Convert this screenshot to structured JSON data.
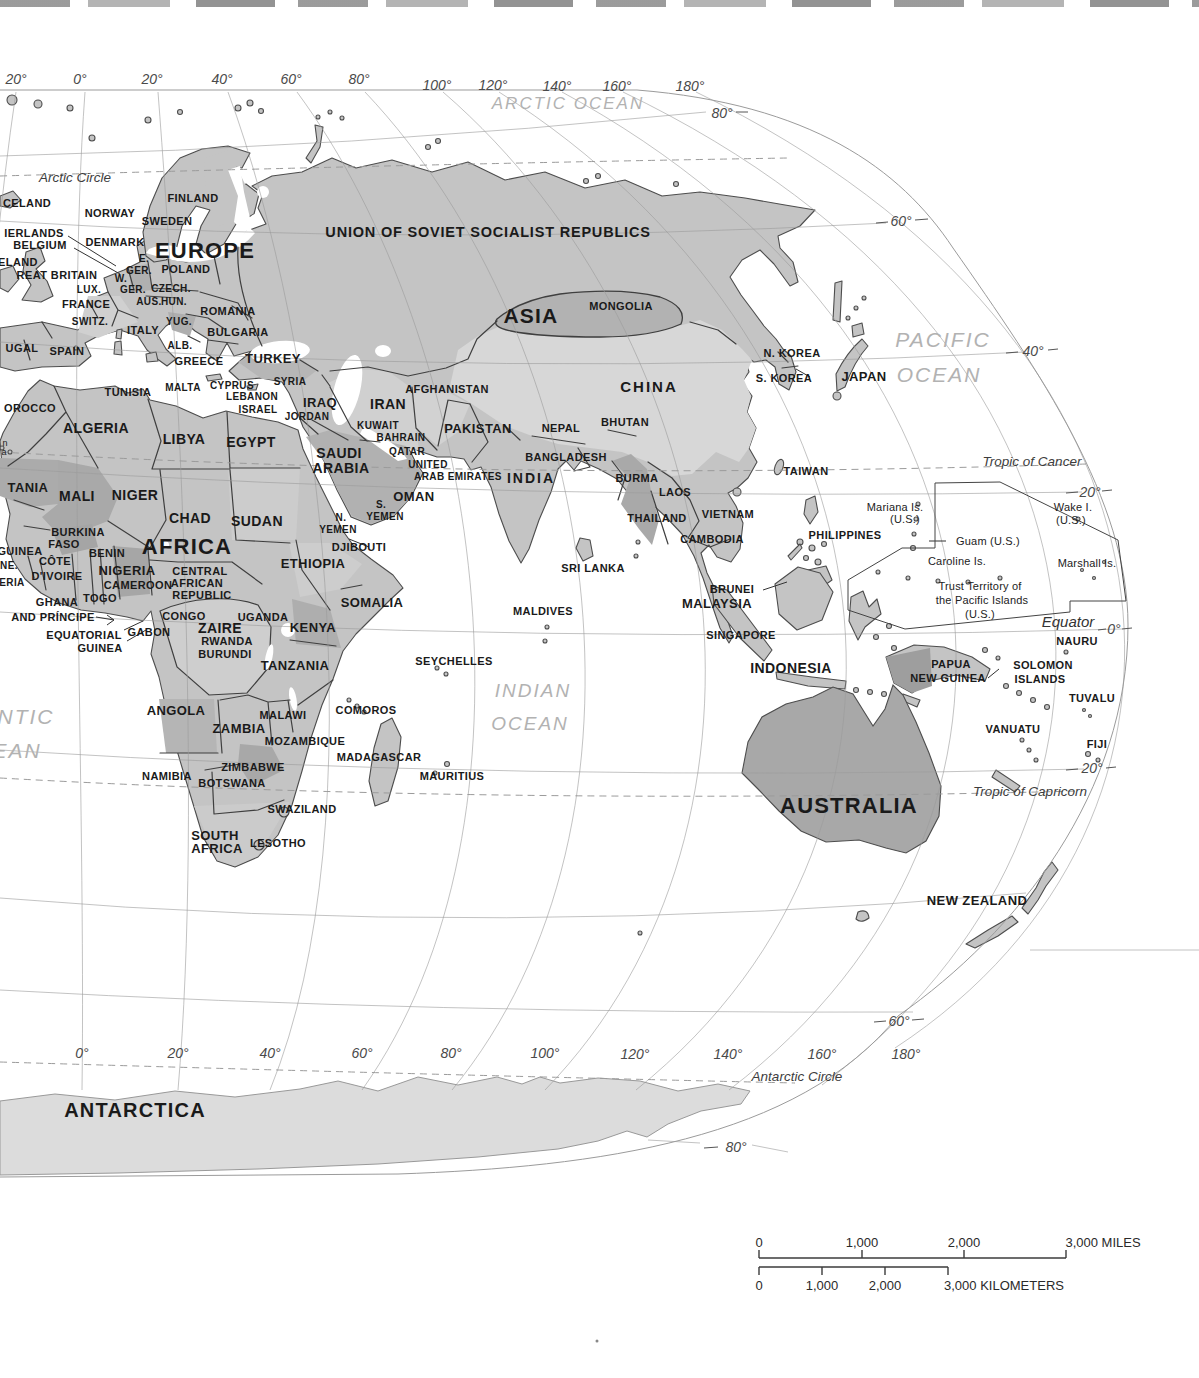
{
  "colors": {
    "paper": "#ffffff",
    "land": "#c4c4c4",
    "land_dark": "#a8a8a8",
    "land_mid": "#b6b6b6",
    "land_light": "#d6d6d6",
    "ice": "#dcdcdc",
    "coast": "#4d4d4d",
    "border": "#3f3f3f",
    "graticule": "#9b9b9b",
    "label": "#1a1a1a",
    "ocean_label": "#b2b2b2"
  },
  "scale_bar": {
    "miles": {
      "ticks": [
        "0",
        "1,000",
        "2,000"
      ],
      "end_label": "3,000 MILES"
    },
    "kilometers": {
      "ticks": [
        "0",
        "1,000",
        "2,000"
      ],
      "end_label": "3,000 KILOMETERS"
    }
  },
  "labels": [
    {
      "t": "20°",
      "x": 16,
      "y": 79,
      "c": "coord"
    },
    {
      "t": "0°",
      "x": 80,
      "y": 79,
      "c": "coord"
    },
    {
      "t": "20°",
      "x": 152,
      "y": 79,
      "c": "coord"
    },
    {
      "t": "40°",
      "x": 222,
      "y": 79,
      "c": "coord"
    },
    {
      "t": "60°",
      "x": 291,
      "y": 79,
      "c": "coord"
    },
    {
      "t": "80°",
      "x": 359,
      "y": 79,
      "c": "coord"
    },
    {
      "t": "100°",
      "x": 437,
      "y": 85,
      "c": "coord"
    },
    {
      "t": "120°",
      "x": 493,
      "y": 85,
      "c": "coord"
    },
    {
      "t": "140°",
      "x": 557,
      "y": 86,
      "c": "coord"
    },
    {
      "t": "160°",
      "x": 617,
      "y": 86,
      "c": "coord"
    },
    {
      "t": "180°",
      "x": 690,
      "y": 86,
      "c": "coord"
    },
    {
      "t": "80°",
      "x": 722,
      "y": 113,
      "c": "coord"
    },
    {
      "t": "60°",
      "x": 901,
      "y": 221,
      "c": "coord"
    },
    {
      "t": "40°",
      "x": 1033,
      "y": 351,
      "c": "coord"
    },
    {
      "t": "20°",
      "x": 1090,
      "y": 492,
      "c": "coord"
    },
    {
      "t": "0°",
      "x": 1114,
      "y": 629,
      "c": "coord"
    },
    {
      "t": "20°",
      "x": 1092,
      "y": 768,
      "c": "coord"
    },
    {
      "t": "60°",
      "x": 899,
      "y": 1021,
      "c": "coord"
    },
    {
      "t": "80°",
      "x": 736,
      "y": 1147,
      "c": "coord"
    },
    {
      "t": "0°",
      "x": 82,
      "y": 1053,
      "c": "coord"
    },
    {
      "t": "20°",
      "x": 178,
      "y": 1053,
      "c": "coord"
    },
    {
      "t": "40°",
      "x": 270,
      "y": 1053,
      "c": "coord"
    },
    {
      "t": "60°",
      "x": 362,
      "y": 1053,
      "c": "coord"
    },
    {
      "t": "80°",
      "x": 451,
      "y": 1053,
      "c": "coord"
    },
    {
      "t": "100°",
      "x": 545,
      "y": 1053,
      "c": "coord"
    },
    {
      "t": "120°",
      "x": 635,
      "y": 1054,
      "c": "coord"
    },
    {
      "t": "140°",
      "x": 728,
      "y": 1054,
      "c": "coord"
    },
    {
      "t": "160°",
      "x": 822,
      "y": 1054,
      "c": "coord"
    },
    {
      "t": "180°",
      "x": 906,
      "y": 1054,
      "c": "coord"
    },
    {
      "t": "Arctic Circle",
      "x": 75,
      "y": 178,
      "c": "latline"
    },
    {
      "t": "Tropic of Cancer",
      "x": 1032,
      "y": 462,
      "c": "latline"
    },
    {
      "t": "Equator",
      "x": 1068,
      "y": 621,
      "c": "eqline"
    },
    {
      "t": "Tropic of Capricorn",
      "x": 1030,
      "y": 792,
      "c": "latline"
    },
    {
      "t": "Antarctic Circle",
      "x": 797,
      "y": 1077,
      "c": "latline"
    },
    {
      "t": "ARCTIC OCEAN",
      "x": 568,
      "y": 103,
      "c": "ocean",
      "s": 17
    },
    {
      "t": "PACIFIC",
      "x": 943,
      "y": 339,
      "c": "ocean",
      "s": 21
    },
    {
      "t": "OCEAN",
      "x": 939,
      "y": 374,
      "c": "ocean",
      "s": 21
    },
    {
      "t": "INDIAN",
      "x": 533,
      "y": 690,
      "c": "ocean",
      "s": 19
    },
    {
      "t": "OCEAN",
      "x": 530,
      "y": 723,
      "c": "ocean",
      "s": 19
    },
    {
      "t": "NTIC",
      "x": 26,
      "y": 716,
      "c": "ocean",
      "s": 21
    },
    {
      "t": "EAN",
      "x": 17,
      "y": 750,
      "c": "ocean",
      "s": 21
    },
    {
      "t": "EUROPE",
      "x": 205,
      "y": 251,
      "c": "continent"
    },
    {
      "t": "AFRICA",
      "x": 187,
      "y": 547,
      "c": "continent"
    },
    {
      "t": "ASIA",
      "x": 531,
      "y": 315,
      "c": "continent",
      "s": 21
    },
    {
      "t": "AUSTRALIA",
      "x": 849,
      "y": 806,
      "c": "continent"
    },
    {
      "t": "ANTARCTICA",
      "x": 135,
      "y": 1110,
      "c": "continent",
      "s": 20
    },
    {
      "t": "UNION OF SOVIET SOCIALIST REPUBLICS",
      "x": 488,
      "y": 232,
      "c": "wide"
    },
    {
      "t": "CELAND",
      "x": 27,
      "y": 203,
      "c": "country"
    },
    {
      "t": "NORWAY",
      "x": 110,
      "y": 213,
      "c": "country"
    },
    {
      "t": "FINLAND",
      "x": 193,
      "y": 198,
      "c": "country"
    },
    {
      "t": "SWEDEN",
      "x": 167,
      "y": 221,
      "c": "country"
    },
    {
      "t": "IERLANDS",
      "x": 34,
      "y": 233,
      "c": "country"
    },
    {
      "t": "DENMARK",
      "x": 115,
      "y": 242,
      "c": "country"
    },
    {
      "t": "BELGIUM",
      "x": 40,
      "y": 245,
      "c": "country"
    },
    {
      "t": "ELAND",
      "x": 18,
      "y": 262,
      "c": "country"
    },
    {
      "t": "REAT BRITAIN",
      "x": 57,
      "y": 275,
      "c": "country"
    },
    {
      "t": "E.",
      "x": 144,
      "y": 259,
      "c": "country",
      "s": 10
    },
    {
      "t": "GER.",
      "x": 139,
      "y": 271,
      "c": "country",
      "s": 10
    },
    {
      "t": "POLAND",
      "x": 186,
      "y": 269,
      "c": "country"
    },
    {
      "t": "W.",
      "x": 121,
      "y": 279,
      "c": "country",
      "s": 10
    },
    {
      "t": "GER.",
      "x": 133,
      "y": 290,
      "c": "country",
      "s": 10
    },
    {
      "t": "CZECH.",
      "x": 171,
      "y": 289,
      "c": "country",
      "s": 10
    },
    {
      "t": "LUX.",
      "x": 89,
      "y": 290,
      "c": "country",
      "s": 10
    },
    {
      "t": "FRANCE",
      "x": 86,
      "y": 304,
      "c": "country"
    },
    {
      "t": "AUS.",
      "x": 149,
      "y": 302,
      "c": "country",
      "s": 10
    },
    {
      "t": "HUN.",
      "x": 174,
      "y": 302,
      "c": "country",
      "s": 10
    },
    {
      "t": "ROMANIA",
      "x": 228,
      "y": 311,
      "c": "country"
    },
    {
      "t": "SWITZ.",
      "x": 90,
      "y": 322,
      "c": "country",
      "s": 10
    },
    {
      "t": "ITALY",
      "x": 143,
      "y": 330,
      "c": "country"
    },
    {
      "t": "YUG.",
      "x": 179,
      "y": 322,
      "c": "country",
      "s": 10
    },
    {
      "t": "BULGARIA",
      "x": 238,
      "y": 332,
      "c": "country"
    },
    {
      "t": "ALB.",
      "x": 180,
      "y": 346,
      "c": "country",
      "s": 10
    },
    {
      "t": "GREECE",
      "x": 199,
      "y": 361,
      "c": "country"
    },
    {
      "t": "UGAL",
      "x": 22,
      "y": 348,
      "c": "country"
    },
    {
      "t": "SPAIN",
      "x": 67,
      "y": 351,
      "c": "country"
    },
    {
      "t": "TURKEY",
      "x": 273,
      "y": 358,
      "c": "country",
      "s": 13
    },
    {
      "t": "MALTA",
      "x": 183,
      "y": 388,
      "c": "country",
      "s": 10
    },
    {
      "t": "CYPRUS",
      "x": 232,
      "y": 386,
      "c": "country",
      "s": 10
    },
    {
      "t": "SYRIA",
      "x": 290,
      "y": 382,
      "c": "country",
      "s": 10
    },
    {
      "t": "LEBANON",
      "x": 252,
      "y": 397,
      "c": "country",
      "s": 10
    },
    {
      "t": "ISRAEL",
      "x": 258,
      "y": 410,
      "c": "country",
      "s": 10
    },
    {
      "t": "JORDAN",
      "x": 307,
      "y": 417,
      "c": "country",
      "s": 10
    },
    {
      "t": "IRAQ",
      "x": 320,
      "y": 402,
      "c": "country",
      "s": 13
    },
    {
      "t": "IRAN",
      "x": 388,
      "y": 404,
      "c": "country",
      "s": 14
    },
    {
      "t": "KUWAIT",
      "x": 378,
      "y": 426,
      "c": "country",
      "s": 10
    },
    {
      "t": "BAHRAIN",
      "x": 401,
      "y": 438,
      "c": "country",
      "s": 10
    },
    {
      "t": "QATAR",
      "x": 407,
      "y": 452,
      "c": "country",
      "s": 10
    },
    {
      "t": "UNITED",
      "x": 428,
      "y": 465,
      "c": "country",
      "s": 10
    },
    {
      "t": "ARAB EMIRATES",
      "x": 458,
      "y": 477,
      "c": "country",
      "s": 10
    },
    {
      "t": "OMAN",
      "x": 414,
      "y": 496,
      "c": "country",
      "s": 13
    },
    {
      "t": "SAUDI",
      "x": 339,
      "y": 453,
      "c": "country",
      "s": 14
    },
    {
      "t": "ARABIA",
      "x": 341,
      "y": 468,
      "c": "country",
      "s": 14
    },
    {
      "t": "S.",
      "x": 381,
      "y": 505,
      "c": "country",
      "s": 10
    },
    {
      "t": "YEMEN",
      "x": 385,
      "y": 517,
      "c": "country",
      "s": 10
    },
    {
      "t": "N.",
      "x": 341,
      "y": 518,
      "c": "country",
      "s": 10
    },
    {
      "t": "YEMEN",
      "x": 338,
      "y": 530,
      "c": "country",
      "s": 10
    },
    {
      "t": "OROCCO",
      "x": 30,
      "y": 408,
      "c": "country"
    },
    {
      "t": "TUNISIA",
      "x": 128,
      "y": 392,
      "c": "country"
    },
    {
      "t": "ALGERIA",
      "x": 96,
      "y": 428,
      "c": "country",
      "s": 14
    },
    {
      "t": "LIBYA",
      "x": 184,
      "y": 439,
      "c": "country",
      "s": 14
    },
    {
      "t": "EGYPT",
      "x": 251,
      "y": 442,
      "c": "country",
      "s": 14
    },
    {
      "t": "TANIA",
      "x": 28,
      "y": 487,
      "c": "country",
      "s": 13
    },
    {
      "t": "MALI",
      "x": 77,
      "y": 496,
      "c": "country",
      "s": 14
    },
    {
      "t": "NIGER",
      "x": 135,
      "y": 495,
      "c": "country",
      "s": 14
    },
    {
      "t": "CHAD",
      "x": 190,
      "y": 518,
      "c": "country",
      "s": 14
    },
    {
      "t": "SUDAN",
      "x": 257,
      "y": 521,
      "c": "country",
      "s": 14
    },
    {
      "t": "BURKINA",
      "x": 78,
      "y": 532,
      "c": "country"
    },
    {
      "t": "FASO",
      "x": 64,
      "y": 544,
      "c": "country"
    },
    {
      "t": "GUINEA",
      "x": 20,
      "y": 551,
      "c": "country"
    },
    {
      "t": "BENIN",
      "x": 107,
      "y": 553,
      "c": "country"
    },
    {
      "t": "NE.",
      "x": 9,
      "y": 566,
      "c": "country",
      "s": 10
    },
    {
      "t": "CÔTE",
      "x": 55,
      "y": 561,
      "c": "country"
    },
    {
      "t": "D'IVOIRE",
      "x": 57,
      "y": 576,
      "c": "country"
    },
    {
      "t": "ERIA",
      "x": 12,
      "y": 583,
      "c": "country",
      "s": 10
    },
    {
      "t": "NIGERIA",
      "x": 127,
      "y": 570,
      "c": "country",
      "s": 13
    },
    {
      "t": "CAMEROON",
      "x": 138,
      "y": 585,
      "c": "country"
    },
    {
      "t": "CENTRAL",
      "x": 200,
      "y": 571,
      "c": "country"
    },
    {
      "t": "AFRICAN",
      "x": 197,
      "y": 583,
      "c": "country"
    },
    {
      "t": "REPUBLIC",
      "x": 202,
      "y": 595,
      "c": "country"
    },
    {
      "t": "ETHIOPIA",
      "x": 313,
      "y": 563,
      "c": "country",
      "s": 13
    },
    {
      "t": "DJIBOUTI",
      "x": 359,
      "y": 547,
      "c": "country"
    },
    {
      "t": "SOMALIA",
      "x": 372,
      "y": 602,
      "c": "country",
      "s": 13
    },
    {
      "t": "GHANA",
      "x": 57,
      "y": 602,
      "c": "country"
    },
    {
      "t": "TOGO",
      "x": 100,
      "y": 598,
      "c": "country"
    },
    {
      "t": "AND PRÍNCIPE",
      "x": 53,
      "y": 617,
      "c": "country"
    },
    {
      "t": "EQUATORIAL",
      "x": 84,
      "y": 635,
      "c": "country"
    },
    {
      "t": "GUINEA",
      "x": 100,
      "y": 648,
      "c": "country"
    },
    {
      "t": "GABON",
      "x": 149,
      "y": 632,
      "c": "country"
    },
    {
      "t": "CONGO",
      "x": 184,
      "y": 616,
      "c": "country"
    },
    {
      "t": "ZAIRE",
      "x": 220,
      "y": 628,
      "c": "country",
      "s": 14
    },
    {
      "t": "UGANDA",
      "x": 263,
      "y": 617,
      "c": "country"
    },
    {
      "t": "KENYA",
      "x": 313,
      "y": 627,
      "c": "country",
      "s": 13
    },
    {
      "t": "RWANDA",
      "x": 227,
      "y": 641,
      "c": "country"
    },
    {
      "t": "BURUNDI",
      "x": 225,
      "y": 654,
      "c": "country"
    },
    {
      "t": "TANZANIA",
      "x": 295,
      "y": 665,
      "c": "country",
      "s": 13
    },
    {
      "t": "ANGOLA",
      "x": 176,
      "y": 710,
      "c": "country",
      "s": 13
    },
    {
      "t": "ZAMBIA",
      "x": 239,
      "y": 728,
      "c": "country",
      "s": 13
    },
    {
      "t": "MALAWI",
      "x": 283,
      "y": 715,
      "c": "country"
    },
    {
      "t": "COMOROS",
      "x": 366,
      "y": 710,
      "c": "country"
    },
    {
      "t": "MOZAMBIQUE",
      "x": 305,
      "y": 741,
      "c": "country"
    },
    {
      "t": "MADAGASCAR",
      "x": 379,
      "y": 757,
      "c": "country"
    },
    {
      "t": "ZIMBABWE",
      "x": 253,
      "y": 767,
      "c": "country"
    },
    {
      "t": "NAMIBIA",
      "x": 167,
      "y": 776,
      "c": "country"
    },
    {
      "t": "BOTSWANA",
      "x": 232,
      "y": 783,
      "c": "country"
    },
    {
      "t": "MAURITIUS",
      "x": 452,
      "y": 776,
      "c": "country"
    },
    {
      "t": "SWAZILAND",
      "x": 302,
      "y": 809,
      "c": "country"
    },
    {
      "t": "SOUTH",
      "x": 215,
      "y": 835,
      "c": "country",
      "s": 13
    },
    {
      "t": "AFRICA",
      "x": 217,
      "y": 848,
      "c": "country",
      "s": 13
    },
    {
      "t": "LESOTHO",
      "x": 278,
      "y": 843,
      "c": "country"
    },
    {
      "t": "SEYCHELLES",
      "x": 454,
      "y": 661,
      "c": "country"
    },
    {
      "t": "MALDIVES",
      "x": 543,
      "y": 611,
      "c": "country"
    },
    {
      "t": "MONGOLIA",
      "x": 621,
      "y": 306,
      "c": "country"
    },
    {
      "t": "CHINA",
      "x": 649,
      "y": 386,
      "c": "country-lg"
    },
    {
      "t": "INDIA",
      "x": 531,
      "y": 478,
      "c": "country-lg",
      "s": 14
    },
    {
      "t": "N. KOREA",
      "x": 792,
      "y": 353,
      "c": "country"
    },
    {
      "t": "S. KOREA",
      "x": 784,
      "y": 378,
      "c": "country"
    },
    {
      "t": "JAPAN",
      "x": 864,
      "y": 376,
      "c": "country",
      "s": 13
    },
    {
      "t": "AFGHANISTAN",
      "x": 447,
      "y": 389,
      "c": "country"
    },
    {
      "t": "PAKISTAN",
      "x": 478,
      "y": 428,
      "c": "country",
      "s": 13
    },
    {
      "t": "NEPAL",
      "x": 561,
      "y": 428,
      "c": "country"
    },
    {
      "t": "BHUTAN",
      "x": 625,
      "y": 422,
      "c": "country"
    },
    {
      "t": "BANGLADESH",
      "x": 566,
      "y": 457,
      "c": "country"
    },
    {
      "t": "BURMA",
      "x": 637,
      "y": 478,
      "c": "country"
    },
    {
      "t": "LAOS",
      "x": 675,
      "y": 492,
      "c": "country"
    },
    {
      "t": "THAILAND",
      "x": 657,
      "y": 518,
      "c": "country"
    },
    {
      "t": "VIETNAM",
      "x": 728,
      "y": 514,
      "c": "country"
    },
    {
      "t": "CAMBODIA",
      "x": 712,
      "y": 539,
      "c": "country"
    },
    {
      "t": "TAIWAN",
      "x": 806,
      "y": 471,
      "c": "country"
    },
    {
      "t": "SRI LANKA",
      "x": 593,
      "y": 568,
      "c": "country"
    },
    {
      "t": "PHILIPPINES",
      "x": 845,
      "y": 535,
      "c": "country"
    },
    {
      "t": "BRUNEI",
      "x": 732,
      "y": 589,
      "c": "country"
    },
    {
      "t": "MALAYSIA",
      "x": 717,
      "y": 603,
      "c": "country",
      "s": 13
    },
    {
      "t": "SINGAPORE",
      "x": 741,
      "y": 635,
      "c": "country"
    },
    {
      "t": "INDONESIA",
      "x": 791,
      "y": 668,
      "c": "country",
      "s": 14
    },
    {
      "t": "Mariana Is.",
      "x": 895,
      "y": 507,
      "c": "small"
    },
    {
      "t": "(U.S.)",
      "x": 905,
      "y": 519,
      "c": "small"
    },
    {
      "t": "Wake I.",
      "x": 1073,
      "y": 507,
      "c": "small"
    },
    {
      "t": "(U.S.)",
      "x": 1071,
      "y": 520,
      "c": "small"
    },
    {
      "t": "Guam (U.S.)",
      "x": 988,
      "y": 541,
      "c": "small"
    },
    {
      "t": "Caroline Is.",
      "x": 957,
      "y": 561,
      "c": "small"
    },
    {
      "t": "Marshall Is.",
      "x": 1087,
      "y": 563,
      "c": "small"
    },
    {
      "t": "Trust Territory of",
      "x": 980,
      "y": 586,
      "c": "small"
    },
    {
      "t": "the Pacific Islands",
      "x": 982,
      "y": 600,
      "c": "small"
    },
    {
      "t": "(U.S.)",
      "x": 980,
      "y": 614,
      "c": "small"
    },
    {
      "t": "NAURU",
      "x": 1077,
      "y": 641,
      "c": "country"
    },
    {
      "t": "PAPUA",
      "x": 951,
      "y": 664,
      "c": "country"
    },
    {
      "t": "NEW GUINEA",
      "x": 948,
      "y": 678,
      "c": "country"
    },
    {
      "t": "SOLOMON",
      "x": 1043,
      "y": 665,
      "c": "country"
    },
    {
      "t": "ISLANDS",
      "x": 1040,
      "y": 679,
      "c": "country"
    },
    {
      "t": "TUVALU",
      "x": 1092,
      "y": 698,
      "c": "country"
    },
    {
      "t": "VANUATU",
      "x": 1013,
      "y": 729,
      "c": "country"
    },
    {
      "t": "FIJI",
      "x": 1097,
      "y": 744,
      "c": "country"
    },
    {
      "t": "NEW ZEALAND",
      "x": 977,
      "y": 900,
      "c": "country",
      "s": 13
    },
    {
      "t": "n",
      "x": 5,
      "y": 443,
      "c": "small",
      "s": 9
    },
    {
      "t": "a",
      "x": 4,
      "y": 452,
      "c": "small",
      "s": 9
    },
    {
      "t": "0",
      "x": 759,
      "y": 1242,
      "c": "scale"
    },
    {
      "t": "1,000",
      "x": 862,
      "y": 1242,
      "c": "scale"
    },
    {
      "t": "2,000",
      "x": 964,
      "y": 1242,
      "c": "scale"
    },
    {
      "t": "3,000 MILES",
      "x": 1103,
      "y": 1242,
      "c": "scale"
    },
    {
      "t": "0",
      "x": 759,
      "y": 1285,
      "c": "scale"
    },
    {
      "t": "1,000",
      "x": 822,
      "y": 1285,
      "c": "scale"
    },
    {
      "t": "2,000",
      "x": 885,
      "y": 1285,
      "c": "scale"
    },
    {
      "t": "3,000 KILOMETERS",
      "x": 1004,
      "y": 1285,
      "c": "scale"
    }
  ]
}
